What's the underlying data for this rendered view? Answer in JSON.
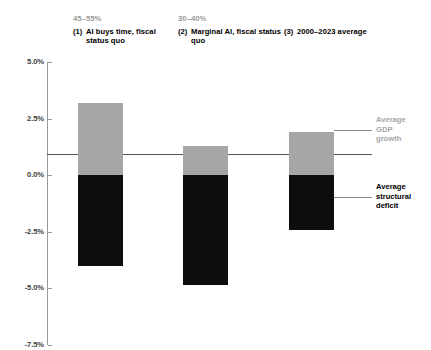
{
  "chart_data": {
    "type": "bar",
    "title": "",
    "subtitle": "",
    "xlabel": "",
    "ylabel": "",
    "ylim": [
      -7.5,
      5.0
    ],
    "grid": false,
    "legend_position": "right-inline",
    "yticks": [
      "5.0%",
      "2.5%",
      "0.0%",
      "-2.5%",
      "-5.0%",
      "-7.5%"
    ],
    "ytick_values": [
      5.0,
      2.5,
      0.0,
      -2.5,
      -5.0,
      -7.5
    ],
    "categories": [
      "(1) AI buys time, fiscal status quo",
      "(2) Marginal AI, fiscal status quo",
      "(3) 2000-2023 average"
    ],
    "category_ranges": [
      "45–55%",
      "30–40%",
      ""
    ],
    "series": [
      {
        "name": "Average GDP growth",
        "color": "#a6a6a6",
        "values": [
          3.2,
          1.3,
          1.9
        ]
      },
      {
        "name": "Average structural deficit",
        "color": "#0d0d0d",
        "values": [
          -4.0,
          -4.85,
          -2.4
        ]
      }
    ]
  },
  "columns": [
    {
      "range": "45–55%",
      "number": "(1)",
      "label": "AI buys time, fiscal status quo",
      "gdp_growth": 3.2,
      "structural_deficit": -4.0
    },
    {
      "range": "30–40%",
      "number": "(2)",
      "label": "Marginal AI, fiscal status quo",
      "gdp_growth": 1.3,
      "structural_deficit": -4.85
    },
    {
      "range": "",
      "number": "(3)",
      "label": "2000–2023 average",
      "gdp_growth": 1.9,
      "structural_deficit": -2.4
    }
  ],
  "y_axis": {
    "ticks": [
      "5.0%",
      "2.5%",
      "0.0%",
      "-2.5%",
      "-5.0%",
      "-7.5%"
    ]
  },
  "annotations": {
    "gdp_growth": "Average\nGDP\ngrowth",
    "gdp_growth_lines": [
      "Average",
      "GDP",
      "growth"
    ],
    "structural_deficit": "Average\nstructural\ndeficit",
    "structural_deficit_lines": [
      "Average",
      "structural",
      "deficit"
    ]
  },
  "colors": {
    "positive_bar": "#a6a6a6",
    "negative_bar": "#0d0d0d",
    "axis": "#9a9a9a",
    "zero_line": "#555555",
    "range_text": "#9a9a9a",
    "label_text": "#000000"
  }
}
